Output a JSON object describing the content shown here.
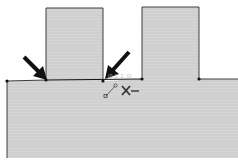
{
  "viewport": {
    "type": "cad-sketch",
    "background_color": "#ffffff",
    "fill_color": "#cfcfcf",
    "edge_color": "#2a2a2a",
    "annotation_color": "#111111"
  },
  "sketch": {
    "profile_name": "stepped-profile",
    "regions": [
      "left-boss",
      "right-boss",
      "base"
    ],
    "vertices": [
      "base-left-corner",
      "left-boss-left-corner",
      "left-boss-right-corner",
      "right-boss-left-corner",
      "right-boss-right-corner"
    ]
  },
  "annotations": {
    "arrows": [
      "arrow-to-left-boss-left-corner",
      "arrow-to-left-boss-right-corner"
    ]
  },
  "cursor": {
    "coordinate_readout": "(0.1, 2, 0)",
    "relation_icons": [
      "coincident-icon",
      "midpoint-relation-icon"
    ]
  }
}
